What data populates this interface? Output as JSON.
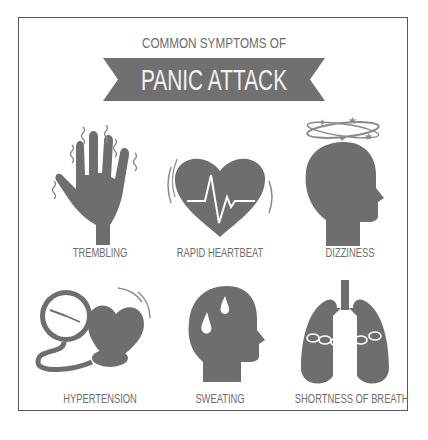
{
  "header": {
    "subtitle": "COMMON SYMPTOMS OF",
    "title": "PANIC ATTACK"
  },
  "colors": {
    "icon_fill": "#6e6e6e",
    "banner_fill": "#707070",
    "label_text": "#6d6d6d",
    "frame_border": "#5a5a5a",
    "background": "#ffffff"
  },
  "symptoms": [
    {
      "label": "TREMBLING",
      "icon": "trembling-hand-icon"
    },
    {
      "label": "RAPID HEARTBEAT",
      "icon": "heartbeat-icon"
    },
    {
      "label": "DIZZINESS",
      "icon": "dizzy-head-icon"
    },
    {
      "label": "HYPERTENSION",
      "icon": "blood-pressure-icon"
    },
    {
      "label": "SWEATING",
      "icon": "sweating-head-icon"
    },
    {
      "label": "SHORTNESS OF BREATH",
      "icon": "chained-lungs-icon"
    }
  ]
}
